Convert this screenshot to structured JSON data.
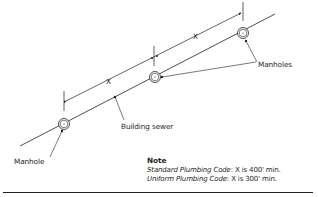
{
  "diagram": {
    "labels": {
      "manholes": "Manholes",
      "manhole": "Manhole",
      "building_sewer": "Building sewer",
      "distance_1": "X",
      "distance_2": "X"
    },
    "note": {
      "title": "Note",
      "lines": [
        {
          "code": "Standard Plumbing Code",
          "rule": ": X is 400' min."
        },
        {
          "code": "Uniform Plumbing Code",
          "rule": ": X is 300' min."
        }
      ]
    },
    "colors": {
      "line": "#231f20",
      "background": "#ffffff"
    }
  }
}
